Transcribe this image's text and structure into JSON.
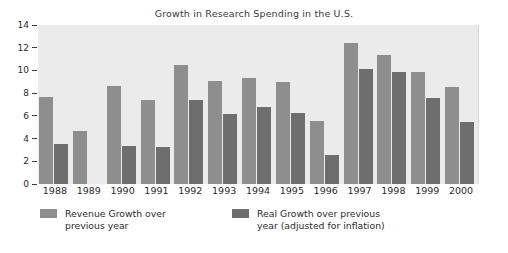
{
  "chart_data": {
    "type": "bar",
    "title": "Growth in Research Spending in the U.S.",
    "xlabel": "",
    "ylabel": "",
    "ylim": [
      0,
      14
    ],
    "yticks": [
      0,
      2,
      4,
      6,
      8,
      10,
      12,
      14
    ],
    "ytick_labels": [
      "0",
      "2",
      "4",
      "6",
      "8",
      "10",
      "12",
      "14"
    ],
    "grid": false,
    "legend_position": "below-plot",
    "categories": [
      "1988",
      "1989",
      "1990",
      "1991",
      "1992",
      "1993",
      "1994",
      "1995",
      "1996",
      "1997",
      "1998",
      "1999",
      "2000"
    ],
    "series": [
      {
        "name": "Revenue Growth over previous year",
        "color": "#8e8e8e",
        "values": [
          7.65,
          4.65,
          8.6,
          7.4,
          10.45,
          9.1,
          9.3,
          8.95,
          5.55,
          12.4,
          11.4,
          9.85,
          8.55
        ]
      },
      {
        "name": "Real Growth over previous year (adjusted for inflation)",
        "color": "#6e6e6e",
        "values": [
          3.55,
          null,
          3.35,
          3.25,
          7.4,
          6.15,
          6.75,
          6.25,
          2.55,
          10.1,
          9.85,
          7.6,
          5.5
        ]
      }
    ]
  },
  "legend": {
    "entries": [
      {
        "label": "Revenue Growth over\nprevious year",
        "color": "#8e8e8e"
      },
      {
        "label": "Real Growth over previous\nyear (adjusted for inflation)",
        "color": "#6e6e6e"
      }
    ]
  },
  "colors": {
    "plot_background": "#ebebeb",
    "page_background": "#ffffff",
    "revenue_bar": "#8e8e8e",
    "real_bar": "#6e6e6e",
    "text": "#2b2b2b"
  }
}
